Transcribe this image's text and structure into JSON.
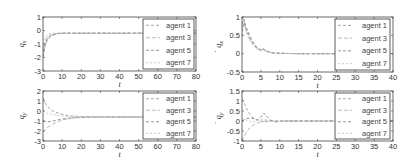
{
  "chart_data": [
    {
      "id": "qx",
      "type": "line",
      "ylabel": "q_x",
      "xlabel": "t",
      "xlim": [
        0,
        80
      ],
      "ylim": [
        -3,
        1
      ],
      "xticks": [
        0,
        10,
        20,
        30,
        40,
        50,
        60,
        70,
        80
      ],
      "yticks": [
        1,
        0,
        -1,
        -2,
        -3
      ],
      "legend": [
        "agent 1",
        "agent 3",
        "agent 5",
        "agent 7"
      ],
      "legend_position": "right",
      "series": [
        {
          "name": "agent 1",
          "x": [
            0,
            1,
            2,
            3,
            5,
            8,
            12,
            20,
            40,
            60,
            80
          ],
          "y": [
            -2.0,
            -1.2,
            -0.8,
            -0.55,
            -0.35,
            -0.22,
            -0.2,
            -0.2,
            -0.2,
            -0.2,
            -0.2
          ]
        },
        {
          "name": "agent 3",
          "x": [
            0,
            1,
            2,
            3,
            5,
            8,
            12,
            20,
            40,
            60,
            80
          ],
          "y": [
            -1.6,
            -0.9,
            -0.55,
            -0.4,
            -0.28,
            -0.21,
            -0.2,
            -0.2,
            -0.2,
            -0.2,
            -0.2
          ]
        },
        {
          "name": "agent 5",
          "x": [
            0,
            1,
            2,
            3,
            5,
            8,
            12,
            20,
            40,
            60,
            80
          ],
          "y": [
            -1.9,
            -1.1,
            -0.7,
            -0.5,
            -0.32,
            -0.22,
            -0.2,
            -0.2,
            -0.2,
            -0.2,
            -0.2
          ]
        },
        {
          "name": "agent 7",
          "x": [
            0,
            1,
            2,
            3,
            5,
            8,
            12,
            20,
            40,
            60,
            80
          ],
          "y": [
            -1.3,
            -0.6,
            -0.35,
            -0.25,
            -0.2,
            -0.19,
            -0.2,
            -0.2,
            -0.2,
            -0.2,
            -0.2
          ]
        }
      ]
    },
    {
      "id": "qx_dot",
      "type": "line",
      "ylabel": "q̇_x",
      "xlabel": "t",
      "xlim": [
        0,
        40
      ],
      "ylim": [
        -0.5,
        1
      ],
      "xticks": [
        0,
        5,
        10,
        15,
        20,
        25,
        30,
        35,
        40
      ],
      "yticks": [
        1,
        0.5,
        0,
        -0.5
      ],
      "legend": [
        "agent 1",
        "agent 3",
        "agent 5",
        "agent 7"
      ],
      "legend_position": "right",
      "series": [
        {
          "name": "agent 1",
          "x": [
            0,
            0.5,
            1,
            2,
            3,
            4,
            5,
            5.5,
            6,
            7,
            8,
            10,
            15,
            40
          ],
          "y": [
            0.6,
            0.85,
            0.7,
            0.45,
            0.28,
            0.15,
            0.1,
            0.13,
            0.1,
            0.05,
            0.02,
            0.01,
            0,
            0
          ]
        },
        {
          "name": "agent 3",
          "x": [
            0,
            0.5,
            1,
            2,
            3,
            4,
            5,
            5.5,
            6,
            7,
            8,
            10,
            15,
            40
          ],
          "y": [
            0.7,
            0.9,
            0.65,
            0.4,
            0.25,
            0.13,
            0.08,
            0.12,
            0.09,
            0.04,
            0.02,
            0.01,
            0,
            0
          ]
        },
        {
          "name": "agent 5",
          "x": [
            0,
            0.5,
            1,
            2,
            3,
            4,
            5,
            5.5,
            6,
            7,
            8,
            10,
            15,
            40
          ],
          "y": [
            0.8,
            0.95,
            0.75,
            0.5,
            0.3,
            0.16,
            0.1,
            0.15,
            0.1,
            0.05,
            0.02,
            0.01,
            0,
            0
          ]
        },
        {
          "name": "agent 7",
          "x": [
            0,
            0.5,
            1,
            2,
            3,
            4,
            5,
            5.5,
            6,
            7,
            8,
            10,
            15,
            40
          ],
          "y": [
            0.5,
            0.8,
            0.6,
            0.38,
            0.22,
            0.12,
            0.07,
            0.1,
            0.08,
            0.04,
            0.01,
            0.01,
            0,
            0
          ]
        }
      ]
    },
    {
      "id": "qy",
      "type": "line",
      "ylabel": "q_y",
      "xlabel": "t",
      "xlim": [
        0,
        80
      ],
      "ylim": [
        -3,
        2
      ],
      "xticks": [
        0,
        10,
        20,
        30,
        40,
        50,
        60,
        70,
        80
      ],
      "yticks": [
        2,
        1,
        0,
        -1,
        -2,
        -3
      ],
      "legend": [
        "agent 1",
        "agent 3",
        "agent 5",
        "agent 7"
      ],
      "legend_position": "right",
      "series": [
        {
          "name": "agent 1",
          "x": [
            0,
            2,
            5,
            10,
            15,
            20,
            30,
            50,
            80
          ],
          "y": [
            1.3,
            0.5,
            0.0,
            -0.35,
            -0.5,
            -0.55,
            -0.6,
            -0.6,
            -0.6
          ]
        },
        {
          "name": "agent 3",
          "x": [
            0,
            2,
            5,
            10,
            15,
            20,
            30,
            50,
            80
          ],
          "y": [
            -2.1,
            -1.7,
            -1.3,
            -0.9,
            -0.72,
            -0.65,
            -0.6,
            -0.6,
            -0.6
          ]
        },
        {
          "name": "agent 5",
          "x": [
            0,
            2,
            5,
            10,
            15,
            20,
            30,
            50,
            80
          ],
          "y": [
            -1.0,
            -1.1,
            -1.0,
            -0.8,
            -0.68,
            -0.63,
            -0.6,
            -0.6,
            -0.6
          ]
        },
        {
          "name": "agent 7",
          "x": [
            0,
            2,
            5,
            10,
            15,
            20,
            30,
            50,
            80
          ],
          "y": [
            0.1,
            -0.2,
            -0.35,
            -0.5,
            -0.57,
            -0.6,
            -0.6,
            -0.6,
            -0.6
          ]
        }
      ]
    },
    {
      "id": "qy_dot",
      "type": "line",
      "ylabel": "q̇_y",
      "xlabel": "t",
      "xlim": [
        0,
        40
      ],
      "ylim": [
        -1,
        1.5
      ],
      "xticks": [
        0,
        5,
        10,
        15,
        20,
        25,
        30,
        35,
        40
      ],
      "yticks": [
        1.5,
        1,
        0.5,
        0,
        -0.5,
        -1
      ],
      "legend": [
        "agent 1",
        "agent 3",
        "agent 5",
        "agent 7"
      ],
      "legend_position": "right",
      "series": [
        {
          "name": "agent 1",
          "x": [
            0,
            0.5,
            1,
            2,
            3,
            4,
            5,
            6,
            7,
            8,
            10,
            12,
            15,
            40
          ],
          "y": [
            1.1,
            0.95,
            0.7,
            0.35,
            0.15,
            0.05,
            0.0,
            -0.05,
            -0.02,
            0.0,
            0.0,
            0.0,
            0,
            0
          ]
        },
        {
          "name": "agent 3",
          "x": [
            0,
            0.5,
            1,
            2,
            3,
            4,
            5,
            6,
            7,
            8,
            10,
            12,
            15,
            40
          ],
          "y": [
            -1.0,
            -0.8,
            -0.6,
            -0.35,
            -0.2,
            -0.1,
            -0.05,
            0.0,
            0.02,
            0.0,
            0.0,
            0.0,
            0,
            0
          ]
        },
        {
          "name": "agent 5",
          "x": [
            0,
            0.5,
            1,
            2,
            3,
            4,
            5,
            5.8,
            6.5,
            7.5,
            9,
            11,
            15,
            40
          ],
          "y": [
            0.0,
            0.05,
            0.1,
            0.15,
            0.12,
            0.05,
            0.2,
            0.4,
            0.25,
            0.05,
            -0.05,
            0.0,
            0,
            0
          ]
        },
        {
          "name": "agent 7",
          "x": [
            0,
            0.5,
            1,
            2,
            3,
            4,
            5,
            6,
            7,
            8,
            10,
            12,
            15,
            40
          ],
          "y": [
            0.15,
            0.1,
            0.05,
            0.0,
            -0.05,
            0.05,
            0.1,
            0.08,
            0.02,
            -0.02,
            0.0,
            0.0,
            0,
            0
          ]
        }
      ]
    }
  ],
  "style": {
    "series_colors": [
      "#9a9a9a",
      "#b4b4b4",
      "#8a8a8a",
      "#c4c4c4"
    ],
    "axis_color": "#444444",
    "legend_box_color": "#333333"
  },
  "panels": [
    {
      "ylabel_main": "q",
      "ylabel_sub": "x",
      "dot": false,
      "xlabel": "t"
    },
    {
      "ylabel_main": "q",
      "ylabel_sub": "x",
      "dot": true,
      "xlabel": "t"
    },
    {
      "ylabel_main": "q",
      "ylabel_sub": "y",
      "dot": false,
      "xlabel": "t"
    },
    {
      "ylabel_main": "q",
      "ylabel_sub": "y",
      "dot": true,
      "xlabel": "t"
    }
  ]
}
